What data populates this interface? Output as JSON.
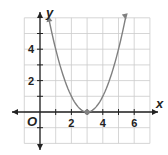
{
  "chart_data": {
    "type": "line",
    "title": "",
    "xlabel": "x",
    "ylabel": "y",
    "origin_label": "O",
    "xlim": [
      -1,
      7
    ],
    "ylim": [
      -2,
      6
    ],
    "x_ticks": [
      2,
      4,
      6
    ],
    "y_ticks": [
      2,
      4
    ],
    "grid": true,
    "series": [
      {
        "name": "y = (x - 3)^2",
        "equation": "y=(x-3)^2",
        "x": [
          0.6,
          1,
          2,
          3,
          4,
          5,
          5.4
        ],
        "values": [
          5.76,
          4,
          1,
          0,
          1,
          4,
          5.76
        ]
      }
    ],
    "points": [
      {
        "x": 3,
        "y": 0,
        "label": "vertex"
      }
    ],
    "colors": {
      "curve": "#808080",
      "grid": "#cccccc",
      "axis": "#222222"
    }
  }
}
